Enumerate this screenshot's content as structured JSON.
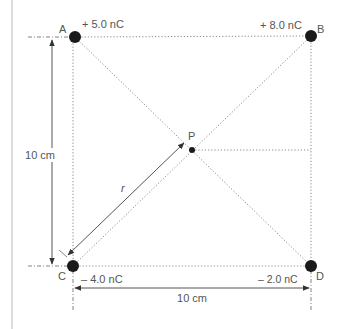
{
  "diagram": {
    "title": "",
    "points": {
      "A": {
        "label": "A",
        "charge": "+ 5.0 nC"
      },
      "B": {
        "label": "B",
        "charge": "+ 8.0 nC"
      },
      "C": {
        "label": "C",
        "charge": "– 4.0 nC"
      },
      "D": {
        "label": "D",
        "charge": "– 2.0 nC"
      },
      "P": {
        "label": "P"
      }
    },
    "dimensions": {
      "vertical": "10 cm",
      "horizontal": "10 cm",
      "radius": "r"
    },
    "colors": {
      "charge": "#1a1a1a",
      "line": "#888888",
      "text": "#555555",
      "border": "#bbbbbb"
    }
  }
}
